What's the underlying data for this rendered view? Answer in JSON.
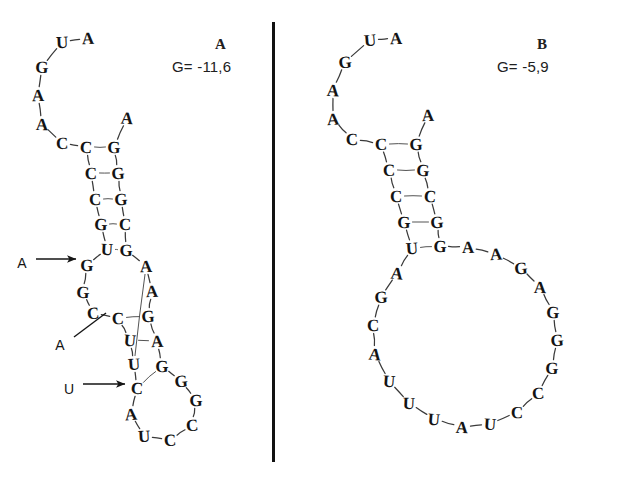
{
  "figure": {
    "background": "#ffffff",
    "ink": "#141414"
  },
  "divider": {
    "name": "panel-divider",
    "x": 272,
    "y": 22,
    "width": 3,
    "height": 440,
    "color": "#111111"
  },
  "panels": [
    {
      "id": "A",
      "label": "A",
      "label_pos": {
        "x": 215,
        "y": 36
      },
      "energy": "G= -11,6",
      "energy_pos": {
        "x": 172,
        "y": 58
      },
      "bases": [
        {
          "id": "a1",
          "letter": "A",
          "x": 88,
          "y": 38
        },
        {
          "id": "a2",
          "letter": "U",
          "x": 62,
          "y": 42
        },
        {
          "id": "a3",
          "letter": "G",
          "x": 42,
          "y": 67
        },
        {
          "id": "a4",
          "letter": "A",
          "x": 38,
          "y": 95
        },
        {
          "id": "a5",
          "letter": "A",
          "x": 42,
          "y": 124
        },
        {
          "id": "a6",
          "letter": "C",
          "x": 62,
          "y": 143
        },
        {
          "id": "a7",
          "letter": "C",
          "x": 86,
          "y": 147
        },
        {
          "id": "a8",
          "letter": "C",
          "x": 91,
          "y": 173
        },
        {
          "id": "a9",
          "letter": "C",
          "x": 95,
          "y": 199
        },
        {
          "id": "a10",
          "letter": "G",
          "x": 101,
          "y": 224
        },
        {
          "id": "a11",
          "letter": "U",
          "x": 107,
          "y": 249
        },
        {
          "id": "a12",
          "letter": "G",
          "x": 87,
          "y": 265
        },
        {
          "id": "a13",
          "letter": "G",
          "x": 83,
          "y": 292
        },
        {
          "id": "a14",
          "letter": "C",
          "x": 93,
          "y": 313
        },
        {
          "id": "a15",
          "letter": "C",
          "x": 118,
          "y": 318
        },
        {
          "id": "a16",
          "letter": "U",
          "x": 130,
          "y": 340
        },
        {
          "id": "a17",
          "letter": "U",
          "x": 134,
          "y": 364
        },
        {
          "id": "a18",
          "letter": "C",
          "x": 137,
          "y": 388
        },
        {
          "id": "a19",
          "letter": "A",
          "x": 131,
          "y": 414
        },
        {
          "id": "a20",
          "letter": "U",
          "x": 144,
          "y": 436
        },
        {
          "id": "a21",
          "letter": "C",
          "x": 170,
          "y": 440
        },
        {
          "id": "a22",
          "letter": "C",
          "x": 192,
          "y": 425
        },
        {
          "id": "a23",
          "letter": "G",
          "x": 196,
          "y": 400
        },
        {
          "id": "a24",
          "letter": "G",
          "x": 181,
          "y": 381
        },
        {
          "id": "a25",
          "letter": "G",
          "x": 162,
          "y": 366
        },
        {
          "id": "a26",
          "letter": "A",
          "x": 157,
          "y": 341
        },
        {
          "id": "a27",
          "letter": "G",
          "x": 148,
          "y": 316
        },
        {
          "id": "a28",
          "letter": "A",
          "x": 152,
          "y": 291
        },
        {
          "id": "a29",
          "letter": "A",
          "x": 146,
          "y": 266
        },
        {
          "id": "a30",
          "letter": "G",
          "x": 126,
          "y": 250
        },
        {
          "id": "a31",
          "letter": "C",
          "x": 125,
          "y": 224
        },
        {
          "id": "a32",
          "letter": "G",
          "x": 121,
          "y": 199
        },
        {
          "id": "a33",
          "letter": "G",
          "x": 118,
          "y": 173
        },
        {
          "id": "a34",
          "letter": "G",
          "x": 114,
          "y": 147
        },
        {
          "id": "a35",
          "letter": "A",
          "x": 127,
          "y": 118
        }
      ],
      "backbone": [
        "a1",
        "a2",
        "a3",
        "a4",
        "a5",
        "a6",
        "a7",
        "a8",
        "a9",
        "a10",
        "a11",
        "a12",
        "a13",
        "a14",
        "a15",
        "a16",
        "a17",
        "a18",
        "a19",
        "a20",
        "a21",
        "a22",
        "a23",
        "a24",
        "a25",
        "a26",
        "a27",
        "a28",
        "a29",
        "a30",
        "a31",
        "a32",
        "a33",
        "a34",
        "a35"
      ],
      "pairs": [
        [
          "a7",
          "a34"
        ],
        [
          "a8",
          "a33"
        ],
        [
          "a9",
          "a32"
        ],
        [
          "a10",
          "a31"
        ],
        [
          "a11",
          "a30"
        ],
        [
          "a15",
          "a27"
        ],
        [
          "a16",
          "a26"
        ],
        [
          "a17",
          "a29"
        ],
        [
          "a18",
          "a25"
        ]
      ],
      "annotations": [
        {
          "name": "arrow-annotation-a-upper",
          "label": "A",
          "label_x": 22,
          "label_y": 263,
          "line": {
            "x1": 36,
            "y1": 259,
            "x2": 76,
            "y2": 259
          },
          "style": "arrow"
        },
        {
          "name": "arrow-annotation-a-middle",
          "label": "A",
          "label_x": 60,
          "label_y": 345,
          "line": {
            "x1": 74,
            "y1": 337,
            "x2": 106,
            "y2": 313
          },
          "style": "plain"
        },
        {
          "name": "arrow-annotation-u-lower",
          "label": "U",
          "label_x": 69,
          "label_y": 389,
          "line": {
            "x1": 83,
            "y1": 384,
            "x2": 125,
            "y2": 384
          },
          "style": "arrow"
        }
      ]
    },
    {
      "id": "B",
      "label": "B",
      "label_pos": {
        "x": 537,
        "y": 36
      },
      "energy": "G= -5,9",
      "energy_pos": {
        "x": 497,
        "y": 58
      },
      "bases": [
        {
          "id": "b1",
          "letter": "A",
          "x": 396,
          "y": 38
        },
        {
          "id": "b2",
          "letter": "U",
          "x": 370,
          "y": 40
        },
        {
          "id": "b3",
          "letter": "G",
          "x": 345,
          "y": 62
        },
        {
          "id": "b4",
          "letter": "A",
          "x": 333,
          "y": 90
        },
        {
          "id": "b5",
          "letter": "A",
          "x": 333,
          "y": 119
        },
        {
          "id": "b6",
          "letter": "C",
          "x": 352,
          "y": 139
        },
        {
          "id": "b7",
          "letter": "C",
          "x": 381,
          "y": 144
        },
        {
          "id": "b8",
          "letter": "C",
          "x": 389,
          "y": 170
        },
        {
          "id": "b9",
          "letter": "C",
          "x": 396,
          "y": 196
        },
        {
          "id": "b10",
          "letter": "G",
          "x": 404,
          "y": 222
        },
        {
          "id": "b11",
          "letter": "U",
          "x": 412,
          "y": 248
        },
        {
          "id": "b12",
          "letter": "A",
          "x": 397,
          "y": 273
        },
        {
          "id": "b13",
          "letter": "G",
          "x": 381,
          "y": 297
        },
        {
          "id": "b14",
          "letter": "C",
          "x": 373,
          "y": 325
        },
        {
          "id": "b15",
          "letter": "A",
          "x": 375,
          "y": 354
        },
        {
          "id": "b16",
          "letter": "U",
          "x": 389,
          "y": 381
        },
        {
          "id": "b17",
          "letter": "U",
          "x": 409,
          "y": 403
        },
        {
          "id": "b18",
          "letter": "U",
          "x": 434,
          "y": 419
        },
        {
          "id": "b19",
          "letter": "A",
          "x": 462,
          "y": 427
        },
        {
          "id": "b20",
          "letter": "U",
          "x": 490,
          "y": 424
        },
        {
          "id": "b21",
          "letter": "C",
          "x": 517,
          "y": 412
        },
        {
          "id": "b22",
          "letter": "C",
          "x": 538,
          "y": 393
        },
        {
          "id": "b23",
          "letter": "G",
          "x": 552,
          "y": 368
        },
        {
          "id": "b24",
          "letter": "G",
          "x": 557,
          "y": 340
        },
        {
          "id": "b25",
          "letter": "G",
          "x": 553,
          "y": 312
        },
        {
          "id": "b26",
          "letter": "A",
          "x": 540,
          "y": 287
        },
        {
          "id": "b27",
          "letter": "G",
          "x": 521,
          "y": 268
        },
        {
          "id": "b28",
          "letter": "A",
          "x": 496,
          "y": 254
        },
        {
          "id": "b29",
          "letter": "A",
          "x": 468,
          "y": 247
        },
        {
          "id": "b30",
          "letter": "G",
          "x": 440,
          "y": 246
        },
        {
          "id": "b31",
          "letter": "G",
          "x": 437,
          "y": 222
        },
        {
          "id": "b32",
          "letter": "C",
          "x": 430,
          "y": 196
        },
        {
          "id": "b33",
          "letter": "G",
          "x": 423,
          "y": 170
        },
        {
          "id": "b34",
          "letter": "G",
          "x": 416,
          "y": 144
        },
        {
          "id": "b35",
          "letter": "A",
          "x": 428,
          "y": 115
        }
      ],
      "backbone": [
        "b1",
        "b2",
        "b3",
        "b4",
        "b5",
        "b6",
        "b7",
        "b8",
        "b9",
        "b10",
        "b11",
        "b12",
        "b13",
        "b14",
        "b15",
        "b16",
        "b17",
        "b18",
        "b19",
        "b20",
        "b21",
        "b22",
        "b23",
        "b24",
        "b25",
        "b26",
        "b27",
        "b28",
        "b29",
        "b30",
        "b31",
        "b32",
        "b33",
        "b34",
        "b35"
      ],
      "pairs": [
        [
          "b7",
          "b34"
        ],
        [
          "b8",
          "b33"
        ],
        [
          "b9",
          "b32"
        ],
        [
          "b10",
          "b31"
        ],
        [
          "b11",
          "b30"
        ]
      ],
      "annotations": []
    }
  ]
}
